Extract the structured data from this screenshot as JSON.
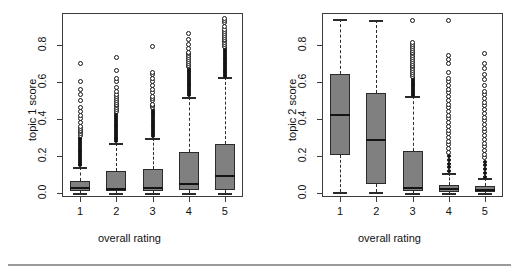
{
  "figure": {
    "width": 519,
    "height": 275,
    "background": "#ffffff",
    "footer_rule_color": "#9a9a9a",
    "box_fill": "#808080",
    "line_color": "#2b2b2b"
  },
  "panels": [
    {
      "id": "left",
      "ylabel": "topic 1 score",
      "xlabel": "overall rating",
      "ytick_labels": [
        "0.0",
        "0.2",
        "0.4",
        "0.6",
        "0.8"
      ],
      "xtick_labels": [
        "1",
        "2",
        "3",
        "4",
        "5"
      ]
    },
    {
      "id": "right",
      "ylabel": "topic 2 score",
      "xlabel": "overall rating",
      "ytick_labels": [
        "0.0",
        "0.2",
        "0.4",
        "0.6",
        "0.8"
      ],
      "xtick_labels": [
        "1",
        "2",
        "3",
        "4",
        "5"
      ]
    }
  ],
  "chart_data": [
    {
      "type": "box",
      "title": "",
      "xlabel": "overall rating",
      "ylabel": "topic 1 score",
      "categories": [
        "1",
        "2",
        "3",
        "4",
        "5"
      ],
      "ylim": [
        -0.02,
        0.97
      ],
      "yticks": [
        0.0,
        0.2,
        0.4,
        0.6,
        0.8
      ],
      "grid": false,
      "legend": "none",
      "boxes": [
        {
          "category": "1",
          "q1": 0.01,
          "median": 0.03,
          "q3": 0.065,
          "whisker_low": 0.0,
          "whisker_high": 0.14,
          "outliers": [
            0.15,
            0.16,
            0.17,
            0.18,
            0.19,
            0.2,
            0.21,
            0.22,
            0.23,
            0.24,
            0.25,
            0.26,
            0.27,
            0.28,
            0.29,
            0.3,
            0.31,
            0.32,
            0.33,
            0.34,
            0.35,
            0.36,
            0.38,
            0.4,
            0.42,
            0.44,
            0.46,
            0.5,
            0.53,
            0.56,
            0.6,
            0.7
          ]
        },
        {
          "category": "2",
          "q1": 0.012,
          "median": 0.025,
          "q3": 0.12,
          "whisker_low": 0.0,
          "whisker_high": 0.27,
          "outliers": [
            0.28,
            0.29,
            0.3,
            0.31,
            0.32,
            0.33,
            0.34,
            0.35,
            0.36,
            0.37,
            0.38,
            0.39,
            0.4,
            0.41,
            0.42,
            0.43,
            0.44,
            0.45,
            0.46,
            0.47,
            0.48,
            0.49,
            0.5,
            0.51,
            0.52,
            0.53,
            0.55,
            0.57,
            0.6,
            0.62,
            0.66,
            0.73
          ]
        },
        {
          "category": "3",
          "q1": 0.012,
          "median": 0.026,
          "q3": 0.13,
          "whisker_low": 0.0,
          "whisker_high": 0.3,
          "outliers": [
            0.31,
            0.32,
            0.33,
            0.34,
            0.35,
            0.36,
            0.37,
            0.38,
            0.39,
            0.4,
            0.41,
            0.42,
            0.43,
            0.44,
            0.45,
            0.46,
            0.47,
            0.48,
            0.5,
            0.51,
            0.52,
            0.54,
            0.56,
            0.58,
            0.6,
            0.62,
            0.64,
            0.65,
            0.79
          ]
        },
        {
          "category": "4",
          "q1": 0.015,
          "median": 0.05,
          "q3": 0.22,
          "whisker_low": 0.0,
          "whisker_high": 0.52,
          "outliers": [
            0.53,
            0.54,
            0.55,
            0.56,
            0.57,
            0.58,
            0.59,
            0.6,
            0.61,
            0.62,
            0.63,
            0.64,
            0.65,
            0.66,
            0.67,
            0.68,
            0.69,
            0.7,
            0.71,
            0.72,
            0.73,
            0.74,
            0.75,
            0.76,
            0.78,
            0.8,
            0.83,
            0.86
          ]
        },
        {
          "category": "5",
          "q1": 0.018,
          "median": 0.095,
          "q3": 0.265,
          "whisker_low": 0.0,
          "whisker_high": 0.625,
          "outliers": [
            0.63,
            0.64,
            0.65,
            0.66,
            0.67,
            0.68,
            0.69,
            0.7,
            0.71,
            0.72,
            0.73,
            0.74,
            0.75,
            0.76,
            0.77,
            0.78,
            0.79,
            0.8,
            0.81,
            0.82,
            0.83,
            0.84,
            0.85,
            0.86,
            0.87,
            0.88,
            0.9,
            0.92,
            0.93,
            0.94
          ]
        }
      ]
    },
    {
      "type": "box",
      "title": "",
      "xlabel": "overall rating",
      "ylabel": "topic 2 score",
      "categories": [
        "1",
        "2",
        "3",
        "4",
        "5"
      ],
      "ylim": [
        -0.02,
        0.97
      ],
      "yticks": [
        0.0,
        0.2,
        0.4,
        0.6,
        0.8
      ],
      "grid": false,
      "legend": "none",
      "boxes": [
        {
          "category": "1",
          "q1": 0.205,
          "median": 0.42,
          "q3": 0.64,
          "whisker_low": 0.005,
          "whisker_high": 0.94,
          "outliers": []
        },
        {
          "category": "2",
          "q1": 0.05,
          "median": 0.285,
          "q3": 0.54,
          "whisker_low": 0.005,
          "whisker_high": 0.935,
          "outliers": []
        },
        {
          "category": "3",
          "q1": 0.012,
          "median": 0.03,
          "q3": 0.225,
          "whisker_low": 0.0,
          "whisker_high": 0.525,
          "outliers": [
            0.53,
            0.54,
            0.55,
            0.56,
            0.57,
            0.58,
            0.59,
            0.6,
            0.61,
            0.62,
            0.63,
            0.64,
            0.65,
            0.66,
            0.67,
            0.68,
            0.69,
            0.7,
            0.71,
            0.72,
            0.73,
            0.74,
            0.75,
            0.76,
            0.77,
            0.78,
            0.79,
            0.8,
            0.81,
            0.93
          ]
        },
        {
          "category": "4",
          "q1": 0.008,
          "median": 0.022,
          "q3": 0.045,
          "whisker_low": 0.0,
          "whisker_high": 0.11,
          "outliers": [
            0.12,
            0.14,
            0.16,
            0.18,
            0.2,
            0.22,
            0.24,
            0.26,
            0.28,
            0.3,
            0.32,
            0.34,
            0.36,
            0.38,
            0.4,
            0.42,
            0.44,
            0.46,
            0.48,
            0.5,
            0.52,
            0.54,
            0.56,
            0.58,
            0.6,
            0.62,
            0.65,
            0.7,
            0.72,
            0.74,
            0.93
          ]
        },
        {
          "category": "5",
          "q1": 0.006,
          "median": 0.018,
          "q3": 0.038,
          "whisker_low": 0.0,
          "whisker_high": 0.08,
          "outliers": [
            0.09,
            0.11,
            0.13,
            0.15,
            0.17,
            0.19,
            0.21,
            0.23,
            0.25,
            0.27,
            0.29,
            0.31,
            0.33,
            0.35,
            0.37,
            0.39,
            0.41,
            0.43,
            0.45,
            0.47,
            0.49,
            0.51,
            0.53,
            0.55,
            0.58,
            0.61,
            0.64,
            0.67,
            0.7,
            0.75
          ]
        }
      ]
    }
  ]
}
